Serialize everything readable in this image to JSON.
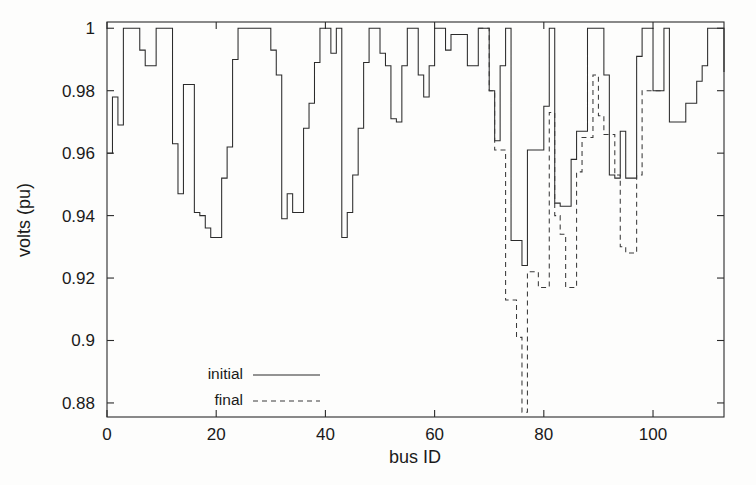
{
  "chart_data": {
    "type": "line",
    "title": "",
    "xlabel": "bus ID",
    "ylabel": "volts (pu)",
    "xlim": [
      0,
      113
    ],
    "ylim": [
      0.878,
      1.002
    ],
    "xticks": [
      0,
      20,
      40,
      60,
      80,
      100
    ],
    "xticklabels": [
      "0",
      "20",
      "40",
      "60",
      "80",
      "100"
    ],
    "yticks": [
      0.88,
      0.9,
      0.92,
      0.94,
      0.96,
      0.98,
      1
    ],
    "yticklabels": [
      "0.88",
      "0.9",
      "0.92",
      "0.94",
      "0.96",
      "0.98",
      "1"
    ],
    "grid": false,
    "drawstyle": "steps-post",
    "legend_position": "lower-left",
    "series": [
      {
        "name": "initial",
        "linestyle": "solid",
        "color": "#2b2b2b",
        "x": [
          0,
          1,
          2,
          3,
          4,
          5,
          6,
          7,
          8,
          9,
          10,
          11,
          12,
          13,
          14,
          15,
          16,
          17,
          18,
          19,
          20,
          21,
          22,
          23,
          24,
          25,
          26,
          27,
          28,
          29,
          30,
          31,
          32,
          33,
          34,
          35,
          36,
          37,
          38,
          39,
          40,
          41,
          42,
          43,
          44,
          45,
          46,
          47,
          48,
          49,
          50,
          51,
          52,
          53,
          54,
          55,
          56,
          57,
          58,
          59,
          60,
          61,
          62,
          63,
          64,
          65,
          66,
          67,
          68,
          69,
          70,
          71,
          72,
          73,
          74,
          75,
          76,
          77,
          78,
          79,
          80,
          81,
          82,
          83,
          84,
          85,
          86,
          87,
          88,
          89,
          90,
          91,
          92,
          93,
          94,
          95,
          96,
          97,
          98,
          99,
          100,
          101,
          102,
          103,
          104,
          105,
          106,
          107,
          108,
          109,
          110,
          111,
          112,
          113
        ],
        "values": [
          0.96,
          0.978,
          0.969,
          1.0,
          1.0,
          1.0,
          0.993,
          0.988,
          0.988,
          1.0,
          1.0,
          1.0,
          0.963,
          0.947,
          0.982,
          0.982,
          0.941,
          0.94,
          0.936,
          0.933,
          0.933,
          0.952,
          0.962,
          0.99,
          1.0,
          1.0,
          1.0,
          1.0,
          1.0,
          1.0,
          0.993,
          0.985,
          0.939,
          0.947,
          0.941,
          0.941,
          0.968,
          0.976,
          0.989,
          1.0,
          1.0,
          0.992,
          1.0,
          0.933,
          0.941,
          0.953,
          0.968,
          0.989,
          1.0,
          1.0,
          0.992,
          0.988,
          0.971,
          0.97,
          0.988,
          1.0,
          1.0,
          0.985,
          0.978,
          0.988,
          1.0,
          1.0,
          0.993,
          0.998,
          0.998,
          0.998,
          0.988,
          0.988,
          1.0,
          1.0,
          0.98,
          0.964,
          0.988,
          1.0,
          0.932,
          0.932,
          0.924,
          0.961,
          0.961,
          0.961,
          0.975,
          1.0,
          0.944,
          0.943,
          0.943,
          0.958,
          0.967,
          0.967,
          1.0,
          1.0,
          1.0,
          0.985,
          0.953,
          0.952,
          0.967,
          0.952,
          0.952,
          0.991,
          1.0,
          1.0,
          0.98,
          0.98,
          1.0,
          0.97,
          0.97,
          0.97,
          0.976,
          0.976,
          0.983,
          0.988,
          1.0,
          1.0,
          1.0,
          0.986
        ]
      },
      {
        "name": "final",
        "linestyle": "dashed",
        "color": "#3a3a3a",
        "x": [
          68,
          69,
          70,
          71,
          72,
          73,
          74,
          75,
          76,
          77,
          78,
          79,
          80,
          81,
          82,
          83,
          84,
          85,
          86,
          87,
          88,
          89,
          90,
          91,
          92,
          93,
          94,
          95,
          96,
          97,
          98,
          99,
          100,
          101
        ],
        "values": [
          1.0,
          1.0,
          0.98,
          0.961,
          0.961,
          0.913,
          0.913,
          0.901,
          0.877,
          0.922,
          0.922,
          0.917,
          0.917,
          0.973,
          0.94,
          0.934,
          0.917,
          0.917,
          0.954,
          0.965,
          0.965,
          0.985,
          0.972,
          0.966,
          0.966,
          0.953,
          0.93,
          0.928,
          0.928,
          0.953,
          0.98,
          0.98,
          0.98,
          0.98
        ],
        "note": "dip at bus 76 extends below the axis minimum (clipped at 0.88)"
      }
    ],
    "legend": [
      {
        "label": "initial",
        "linestyle": "solid"
      },
      {
        "label": "final",
        "linestyle": "dashed"
      }
    ]
  },
  "plot_geometry": {
    "left": 107,
    "right": 724,
    "top": 22,
    "bottom": 417,
    "y_top_value": 1.002,
    "y_bottom_value": 0.8755,
    "x_left_value": 0,
    "x_right_value": 113
  }
}
